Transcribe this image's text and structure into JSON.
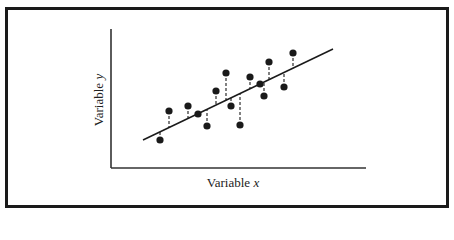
{
  "chart_data": {
    "type": "scatter",
    "title": "",
    "xlabel": "Variable x",
    "ylabel": "Variable y",
    "xlabel_parts": {
      "word": "Variable",
      "symbol": "x"
    },
    "ylabel_parts": {
      "word": "Variable",
      "symbol": "y"
    },
    "grid": false,
    "legend": null,
    "ticks": false,
    "points_px": [
      {
        "x": 160,
        "y": 140
      },
      {
        "x": 169,
        "y": 111
      },
      {
        "x": 188,
        "y": 106
      },
      {
        "x": 198,
        "y": 114
      },
      {
        "x": 207,
        "y": 126
      },
      {
        "x": 216,
        "y": 91
      },
      {
        "x": 226,
        "y": 73
      },
      {
        "x": 231,
        "y": 106
      },
      {
        "x": 240,
        "y": 125
      },
      {
        "x": 250,
        "y": 77
      },
      {
        "x": 260,
        "y": 84
      },
      {
        "x": 264,
        "y": 96
      },
      {
        "x": 269,
        "y": 62
      },
      {
        "x": 284,
        "y": 87
      },
      {
        "x": 293,
        "y": 53
      }
    ],
    "regression_line_px": {
      "x1": 143,
      "y1": 140,
      "x2": 333,
      "y2": 49
    },
    "axes_px": {
      "origin_x": 111,
      "origin_y": 168,
      "y_top": 29,
      "x_right": 366
    },
    "colors": {
      "points": "#1a1a1a",
      "line": "#1a1a1a",
      "axes": "#333333",
      "frame": "#1a1a1a"
    }
  }
}
